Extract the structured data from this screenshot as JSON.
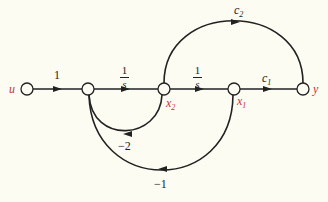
{
  "diagram": {
    "type": "signal-flow-graph",
    "colors": {
      "background": "#fcfcf2",
      "edges": "#222222",
      "node_labels": "#c8323c"
    },
    "nodes": [
      {
        "id": "u",
        "label": "u"
      },
      {
        "id": "n1",
        "label": ""
      },
      {
        "id": "x2",
        "label": "x",
        "sub": "2"
      },
      {
        "id": "x1",
        "label": "x",
        "sub": "1"
      },
      {
        "id": "y",
        "label": "y"
      }
    ],
    "edges": [
      {
        "from": "u",
        "to": "n1",
        "gain": "1"
      },
      {
        "from": "n1",
        "to": "x2",
        "gain_num": "1",
        "gain_den": "s"
      },
      {
        "from": "x2",
        "to": "x1",
        "gain_num": "1",
        "gain_den": "s"
      },
      {
        "from": "x1",
        "to": "y",
        "gain": "c",
        "gain_sub": "1"
      },
      {
        "from": "x2",
        "to": "y",
        "gain": "c",
        "gain_sub": "2"
      },
      {
        "from": "x2",
        "to": "n1",
        "gain": "−2"
      },
      {
        "from": "x1",
        "to": "n1",
        "gain": "−1"
      }
    ]
  }
}
